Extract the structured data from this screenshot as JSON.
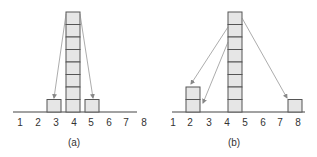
{
  "diagram": {
    "panels": [
      {
        "caption": "(a)",
        "axis_labels": [
          "1",
          "2",
          "3",
          "4",
          "5",
          "6",
          "7",
          "8"
        ],
        "stacks": [
          {
            "position": 3,
            "height": 1
          },
          {
            "position": 4,
            "height": 8
          },
          {
            "position": 5,
            "height": 1
          }
        ],
        "arrows": [
          {
            "from": "top of stack at 4",
            "to": "stack at 3"
          },
          {
            "from": "top of stack at 4",
            "to": "stack at 5"
          }
        ]
      },
      {
        "caption": "(b)",
        "axis_labels": [
          "1",
          "2",
          "3",
          "4",
          "5",
          "6",
          "7",
          "8"
        ],
        "stacks": [
          {
            "position": 2,
            "height": 2
          },
          {
            "position": 4.5,
            "height": 8
          },
          {
            "position": 8,
            "height": 1
          }
        ],
        "arrows": [
          {
            "from": "upper stack at 4.5",
            "to": "top of stack at 2"
          },
          {
            "from": "upper stack at 4.5",
            "to": "bottom of stack at 2"
          },
          {
            "from": "top of stack at 4.5",
            "to": "stack at 8"
          }
        ]
      }
    ],
    "colors": {
      "cell_fill": "#e6e6e6",
      "cell_stroke": "#555555",
      "arrow": "#888888",
      "text": "#333333"
    }
  }
}
